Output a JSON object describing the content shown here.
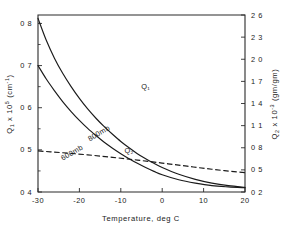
{
  "chart_data": {
    "type": "line",
    "title": "",
    "xlabel": "Temperature,  deg C",
    "ylabel": "Q1 x 105 (cm-1)",
    "y2label": "Q2 x 10-3 (gm/gm)",
    "xlim": [
      -30,
      20
    ],
    "ylim": [
      0.4,
      0.82
    ],
    "y2lim": [
      0.2,
      2.6
    ],
    "grid": false,
    "legend": "inline-curve-labels",
    "xticks": [
      -30,
      -20,
      -10,
      0,
      10,
      20
    ],
    "xticklabels": [
      "-30",
      "-20",
      "-10",
      "0",
      "10",
      "20"
    ],
    "yticks": [
      0.4,
      0.5,
      0.6,
      0.7,
      0.8
    ],
    "yticklabels": [
      "0 4",
      "0 5",
      "0 6",
      "0 7",
      "0 8"
    ],
    "y2ticks": [
      0.2,
      0.5,
      0.8,
      1.1,
      1.4,
      1.7,
      2.0,
      2.3,
      2.6
    ],
    "y2ticklabels": [
      "0 2",
      "0 5",
      "0 8",
      "1 1",
      "1 4",
      "1 7",
      "2 0",
      "2 3",
      "2 6"
    ],
    "series": [
      {
        "name": "Q1",
        "style": "dashed",
        "axis": "right",
        "label": "Q₁",
        "x": [
          -30,
          -27,
          -24,
          -21,
          -18,
          -15,
          -12,
          -9,
          -6,
          -3,
          0,
          3,
          6,
          9,
          12,
          15,
          18,
          20
        ],
        "y": [
          0.757,
          0.745,
          0.732,
          0.718,
          0.703,
          0.687,
          0.67,
          0.652,
          0.633,
          0.613,
          0.592,
          0.571,
          0.55,
          0.529,
          0.509,
          0.49,
          0.473,
          0.462
        ]
      },
      {
        "name": "800mb",
        "style": "solid",
        "axis": "left",
        "label": "800mb",
        "x": [
          -30,
          -28,
          -26,
          -24,
          -22,
          -20,
          -18,
          -16,
          -14,
          -12,
          -10,
          -8,
          -6,
          -4,
          -2,
          0,
          4,
          8,
          12,
          16,
          20
        ],
        "y": [
          0.812,
          0.76,
          0.717,
          0.681,
          0.65,
          0.622,
          0.597,
          0.575,
          0.555,
          0.537,
          0.52,
          0.505,
          0.491,
          0.479,
          0.468,
          0.458,
          0.442,
          0.43,
          0.421,
          0.415,
          0.411
        ]
      },
      {
        "name": "600mb",
        "style": "solid",
        "axis": "left",
        "label": "600mb",
        "x": [
          -30,
          -28,
          -26,
          -24,
          -22,
          -20,
          -18,
          -16,
          -14,
          -12,
          -10,
          -8,
          -6,
          -4,
          -2,
          0,
          4,
          8,
          12,
          16,
          20
        ],
        "y": [
          0.7,
          0.668,
          0.64,
          0.614,
          0.591,
          0.57,
          0.551,
          0.534,
          0.518,
          0.504,
          0.491,
          0.479,
          0.468,
          0.458,
          0.449,
          0.441,
          0.429,
          0.421,
          0.415,
          0.412,
          0.41
        ]
      }
    ],
    "annotations": [
      {
        "text": "Q₁",
        "x": 0.52,
        "y": 0.42
      },
      {
        "text": "Q₂",
        "x": 0.44,
        "y": 0.78
      },
      {
        "text": "800mb",
        "x": 0.3,
        "y": 0.68
      },
      {
        "text": "600mb",
        "x": 0.17,
        "y": 0.79
      }
    ]
  },
  "axes": {
    "left": {
      "symbol": "Q",
      "sub": "1",
      "mult": "x 10",
      "exp": "5",
      "units": "(cm",
      "unit_exp": "-1",
      "units_close": ")"
    },
    "right": {
      "symbol": "Q",
      "sub": "2",
      "mult": "x 10",
      "exp": "-3",
      "units": "(gm/gm)"
    },
    "bottom": {
      "title": "Temperature,  deg C"
    }
  }
}
